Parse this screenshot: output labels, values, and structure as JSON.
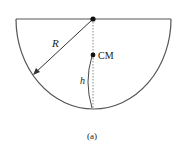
{
  "diagram": {
    "labels": {
      "radius": "R",
      "center_of_mass": "CM",
      "height": "h",
      "caption": "(a)"
    },
    "colors": {
      "stroke": "#555555",
      "dots": "#111111",
      "text": "#222222"
    }
  }
}
